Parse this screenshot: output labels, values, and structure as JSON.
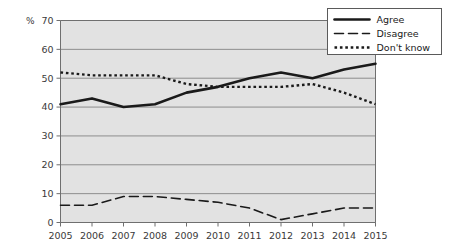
{
  "chart_data": {
    "type": "line",
    "title": "",
    "xlabel": "",
    "ylabel": "",
    "unit_label": "%",
    "categories": [
      "2005",
      "2006",
      "2007",
      "2008",
      "2009",
      "2010",
      "2011",
      "2012",
      "2013",
      "2014",
      "2015"
    ],
    "x": [
      2005,
      2006,
      2007,
      2008,
      2009,
      2010,
      2011,
      2012,
      2013,
      2014,
      2015
    ],
    "ylim": [
      0,
      70
    ],
    "xlim": [
      2005,
      2015
    ],
    "yticks": [
      0,
      10,
      20,
      30,
      40,
      50,
      60,
      70
    ],
    "grid": true,
    "grid_axis": "y",
    "legend_position": "top-right",
    "series": [
      {
        "name": "Agree",
        "style": "solid",
        "color": "#1a1a1a",
        "values": [
          41,
          43,
          40,
          41,
          45,
          47,
          50,
          52,
          50,
          53,
          55
        ]
      },
      {
        "name": "Disagree",
        "style": "dashed",
        "color": "#1a1a1a",
        "values": [
          6,
          6,
          9,
          9,
          8,
          7,
          5,
          1,
          3,
          5,
          5
        ]
      },
      {
        "name": "Don't know",
        "style": "dotted",
        "color": "#1a1a1a",
        "values": [
          52,
          51,
          51,
          51,
          48,
          47,
          47,
          47,
          48,
          45,
          41
        ]
      }
    ]
  },
  "legend": {
    "items": [
      {
        "label": "Agree",
        "style": "solid"
      },
      {
        "label": "Disagree",
        "style": "dashed"
      },
      {
        "label": "Don't know",
        "style": "dotted"
      }
    ]
  },
  "axes": {
    "y_unit": "%",
    "y_tick_labels": [
      "70",
      "60",
      "50",
      "40",
      "30",
      "20",
      "10",
      "0"
    ],
    "x_tick_labels": [
      "2005",
      "2006",
      "2007",
      "2008",
      "2009",
      "2010",
      "2011",
      "2012",
      "2013",
      "2014",
      "2015"
    ]
  },
  "colors": {
    "plot_background": "#e2e2e2",
    "gridline": "#8d8d8d",
    "axis": "#6f6f6f",
    "series_line": "#1a1a1a",
    "legend_background": "#ffffff",
    "legend_border": "#5a5a5a",
    "page_background": "#ffffff"
  }
}
